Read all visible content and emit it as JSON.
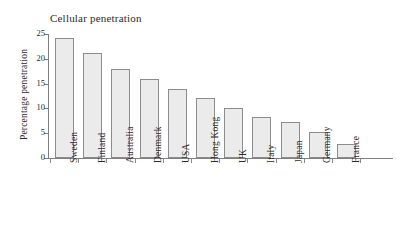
{
  "chart_data": {
    "type": "bar",
    "title": "Cellular penetration",
    "xlabel": "",
    "ylabel": "Percentage penetration",
    "categories": [
      "Sweden",
      "Finland",
      "Australia",
      "Denmark",
      "USA",
      "Hong Kong",
      "UK",
      "Italy",
      "Japan",
      "Germany",
      "France"
    ],
    "values": [
      24.2,
      21.1,
      18.0,
      16.0,
      14.0,
      12.0,
      10.0,
      8.2,
      7.3,
      5.3,
      2.9
    ],
    "ylim": [
      0,
      25
    ],
    "yticks": [
      0,
      5,
      10,
      15,
      20,
      25
    ],
    "ytick_labels": [
      "0",
      "5",
      "10",
      "15",
      "20",
      "25"
    ],
    "grid": false,
    "legend": false,
    "bar_fill_color": "#ebebeb",
    "bar_edge_color": "#8c8c8c",
    "axis_color": "#7f7f7f",
    "text_color": "#2b2b2b",
    "background_color": "#ffffff"
  }
}
